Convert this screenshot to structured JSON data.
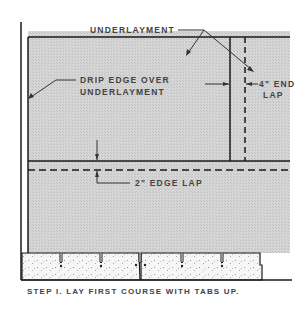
{
  "diagram": {
    "labels": {
      "underlayment": "UNDERLAYMENT",
      "drip_edge_line1": "DRIP EDGE OVER",
      "drip_edge_line2": "UNDERLAYMENT",
      "end_lap_line1": "4\" END",
      "end_lap_line2": "LAP",
      "edge_lap": "2\" EDGE LAP"
    },
    "caption": "STEP I. LAY FIRST COURSE WITH TABS UP.",
    "colors": {
      "ink": "#1a1a1a",
      "underlayment_fill": "#d4d4d4",
      "shingle_fill": "#f2f2f2",
      "text": "#444444"
    }
  }
}
